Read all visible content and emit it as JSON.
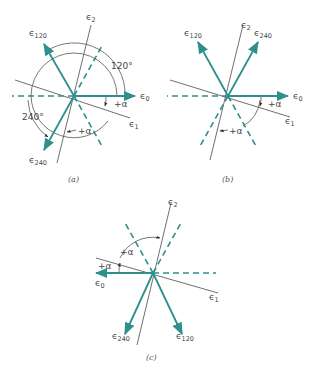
{
  "figure": {
    "panels": [
      {
        "id": "a",
        "caption": "(a)",
        "labels": {
          "e0": "0",
          "e1": "1",
          "e2": "2",
          "e120": "120",
          "e240": "240",
          "angle120": "120°",
          "angle240": "240°",
          "alpha1": "+α",
          "alpha2": "+α"
        }
      },
      {
        "id": "b",
        "caption": "(b)",
        "labels": {
          "e0": "0",
          "e1": "1",
          "e2": "2",
          "e120": "120",
          "e240": "240",
          "alpha1": "+α",
          "alpha2": "+α"
        }
      },
      {
        "id": "c",
        "caption": "(c)",
        "labels": {
          "e0": "0",
          "e1": "1",
          "e2": "2",
          "e120": "120",
          "e240": "240",
          "alpha1": "+α",
          "alpha2": "+α"
        }
      }
    ],
    "symbol": "ϵ",
    "colors": {
      "phasor": "#2e8f8c",
      "reference": "#4a4a4a"
    }
  }
}
